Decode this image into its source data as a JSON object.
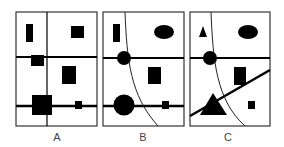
{
  "figure": {
    "colors": {
      "ink": "#000000",
      "frame": "#333333",
      "background": "#ffffff",
      "label": "#444444"
    },
    "panels": [
      {
        "id": "A",
        "label": "A",
        "label_x": 57,
        "frame": {
          "x": 16,
          "y": 12,
          "w": 81,
          "h": 114
        },
        "lines": [
          {
            "type": "vertical",
            "x1": 47,
            "y1": 12,
            "x2": 47,
            "y2": 126,
            "width": 1.2
          },
          {
            "type": "horizontal",
            "x1": 16,
            "y1": 57,
            "x2": 97,
            "y2": 57,
            "width": 2
          },
          {
            "type": "horizontal",
            "x1": 16,
            "y1": 106,
            "x2": 97,
            "y2": 106,
            "width": 2.5
          }
        ],
        "shapes": [
          {
            "kind": "rect",
            "name": "tall-bar",
            "x": 26,
            "y": 24,
            "w": 7,
            "h": 18
          },
          {
            "kind": "rect",
            "name": "square-top-right",
            "x": 71,
            "y": 26,
            "w": 13,
            "h": 12
          },
          {
            "kind": "rect",
            "name": "rect-on-line",
            "x": 31,
            "y": 55,
            "w": 13,
            "h": 11
          },
          {
            "kind": "rect",
            "name": "rect-middle-right",
            "x": 62,
            "y": 66,
            "w": 14,
            "h": 18
          },
          {
            "kind": "rect",
            "name": "large-square",
            "x": 32,
            "y": 95,
            "w": 20,
            "h": 20
          },
          {
            "kind": "rect",
            "name": "small-square",
            "x": 75,
            "y": 101,
            "w": 7,
            "h": 8
          }
        ]
      },
      {
        "id": "B",
        "label": "B",
        "label_x": 143,
        "frame": {
          "x": 103,
          "y": 12,
          "w": 81,
          "h": 114
        },
        "lines": [
          {
            "type": "horizontal",
            "x1": 103,
            "y1": 58,
            "x2": 184,
            "y2": 58,
            "width": 2
          },
          {
            "type": "horizontal",
            "x1": 103,
            "y1": 106,
            "x2": 184,
            "y2": 106,
            "width": 2.5
          }
        ],
        "curve": {
          "path": "M125,12 C127,60 130,95 158,126",
          "width": 1
        },
        "shapes": [
          {
            "kind": "rect",
            "name": "tall-bar",
            "x": 113,
            "y": 24,
            "w": 7,
            "h": 18
          },
          {
            "kind": "ellipse",
            "name": "ellipse-top-right",
            "cx": 164,
            "cy": 32,
            "rx": 10,
            "ry": 7
          },
          {
            "kind": "circle",
            "name": "circle-on-line",
            "cx": 124,
            "cy": 58,
            "r": 7
          },
          {
            "kind": "rect",
            "name": "rect-middle-right",
            "x": 148,
            "y": 67,
            "w": 13,
            "h": 17
          },
          {
            "kind": "circle",
            "name": "large-circle",
            "cx": 124,
            "cy": 105,
            "r": 10.5
          },
          {
            "kind": "rect",
            "name": "small-square",
            "x": 162,
            "y": 101,
            "w": 7,
            "h": 8
          }
        ]
      },
      {
        "id": "C",
        "label": "C",
        "label_x": 228,
        "frame": {
          "x": 190,
          "y": 12,
          "w": 80,
          "h": 114
        },
        "lines": [
          {
            "type": "horizontal",
            "x1": 190,
            "y1": 58,
            "x2": 270,
            "y2": 58,
            "width": 2
          },
          {
            "type": "diagonal",
            "x1": 190,
            "y1": 116,
            "x2": 270,
            "y2": 70,
            "width": 2.5
          }
        ],
        "curve": {
          "path": "M211,12 C213,60 216,100 245,126",
          "width": 1
        },
        "shapes": [
          {
            "kind": "polygon",
            "name": "small-triangle",
            "points": "203,26 199,37 207,37"
          },
          {
            "kind": "ellipse",
            "name": "ellipse-top-right",
            "cx": 248,
            "cy": 32,
            "rx": 10,
            "ry": 7
          },
          {
            "kind": "circle",
            "name": "circle-on-line",
            "cx": 210,
            "cy": 58,
            "r": 7
          },
          {
            "kind": "rect",
            "name": "rect-middle-right",
            "x": 234,
            "y": 67,
            "w": 12,
            "h": 18
          },
          {
            "kind": "polygon",
            "name": "large-triangle",
            "points": "213,93 200,115 227,115"
          },
          {
            "kind": "rect",
            "name": "small-square",
            "x": 248,
            "y": 101,
            "w": 7,
            "h": 8
          }
        ]
      }
    ]
  }
}
